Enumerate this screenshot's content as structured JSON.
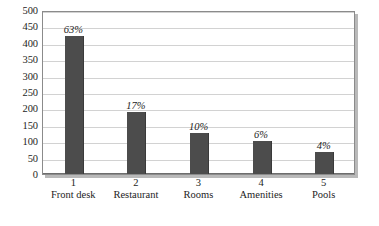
{
  "chart_data": {
    "type": "bar",
    "title": "",
    "subtitle": "",
    "xlabel": "",
    "ylabel": "",
    "categories": [
      "Front desk",
      "Restaurant",
      "Rooms",
      "Amenities",
      "Pools"
    ],
    "category_numbers": [
      "1",
      "2",
      "3",
      "4",
      "5"
    ],
    "values": [
      420,
      190,
      125,
      100,
      68
    ],
    "data_labels": [
      "63%",
      "17%",
      "10%",
      "6%",
      "4%"
    ],
    "ylim": [
      0,
      500
    ],
    "yticks": [
      500,
      450,
      400,
      350,
      300,
      250,
      200,
      150,
      100,
      50,
      0
    ],
    "ytick_labels": [
      "500",
      "450",
      "400",
      "350",
      "300",
      "250",
      "200",
      "150",
      "100",
      "50",
      "0"
    ],
    "grid": "horizontal",
    "legend": "none",
    "bar_color": "#4c4c4c",
    "plot_background": "#ffffff",
    "gridline_color": "#d2d2d2",
    "axis_color": "#8b8b8b",
    "text_color": "#1d1d1d"
  }
}
